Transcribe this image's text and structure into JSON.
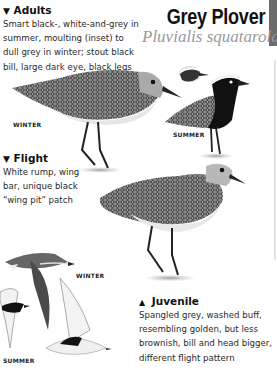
{
  "header": {
    "title": "Grey Plover",
    "latin_name": "Pluvialis squatarola"
  },
  "sections": {
    "adults": {
      "marker": "▼",
      "title": "Adults",
      "lines": [
        "Smart black-, white-and-grey in",
        "summer, moulting (inset) to",
        "dull grey in winter; stout black",
        "bill, large dark eye, black legs"
      ]
    },
    "flight": {
      "marker": "▼",
      "title": "Flight",
      "lines": [
        "White rump, wing",
        "bar, unique black",
        "“wing pit” patch"
      ]
    },
    "juvenile": {
      "marker": "▲",
      "title": "Juvenile",
      "lines": [
        "Spangled grey, washed buff,",
        "resembling golden, but less",
        "brownish, bill and head bigger,",
        "different flight pattern"
      ]
    }
  },
  "captions": {
    "adult_winter": "WINTER",
    "adult_summer": "SUMMER",
    "flight_winter": "WINTER",
    "flight_summer": "SUMMER"
  },
  "colors": {
    "tab": "#6b6b6b",
    "latin": "#9a9a9a",
    "text": "#2a2a2a"
  }
}
